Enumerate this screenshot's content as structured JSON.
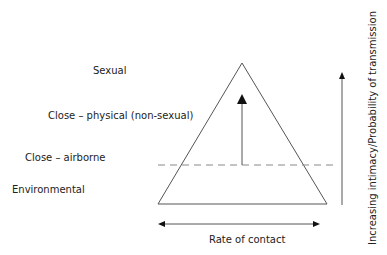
{
  "levels": [
    {
      "label": "Sexual"
    },
    {
      "label": "Close – physical (non-sexual)"
    },
    {
      "label": "Close – airborne"
    },
    {
      "label": "Environmental"
    }
  ],
  "x_axis": {
    "label": "Rate of contact"
  },
  "y_axis": {
    "label": "Increasing intimacy/Probability of transmission"
  },
  "colors": {
    "line": "#555555",
    "dash": "#777777",
    "text": "#222222"
  }
}
